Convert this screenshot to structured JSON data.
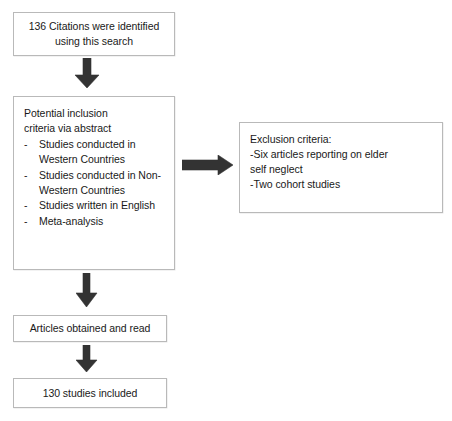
{
  "diagram": {
    "background_color": "#ffffff",
    "box_border_color": "#b9b9b9",
    "arrow_color": "#333333",
    "nodes": {
      "identified": {
        "line1": "136 Citations were identified",
        "line2": "using this search"
      },
      "inclusion": {
        "heading_line1": "Potential inclusion",
        "heading_line2": "criteria via abstract",
        "bullet_marker": "-",
        "items": [
          "Studies conducted in Western Countries",
          "Studies conducted in Non-Western Countries",
          "Studies written in English",
          "Meta-analysis"
        ]
      },
      "exclusion": {
        "heading": "Exclusion criteria:",
        "lines": [
          "-Six articles reporting on elder",
          "self neglect",
          "-Two cohort studies"
        ]
      },
      "obtained": {
        "label": "Articles obtained and read"
      },
      "included": {
        "label": "130 studies included"
      }
    },
    "arrows": [
      {
        "name": "identified-to-inclusion",
        "direction": "down"
      },
      {
        "name": "inclusion-to-exclusion",
        "direction": "right"
      },
      {
        "name": "inclusion-to-obtained",
        "direction": "down"
      },
      {
        "name": "obtained-to-included",
        "direction": "down"
      }
    ]
  }
}
